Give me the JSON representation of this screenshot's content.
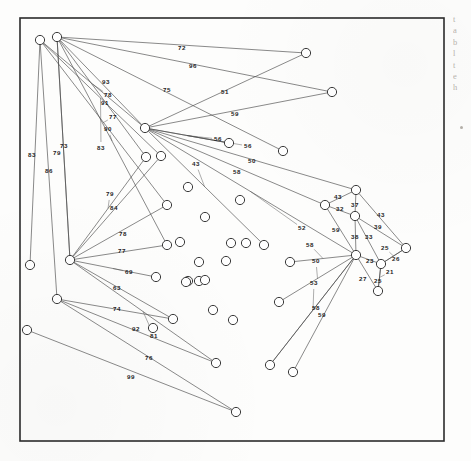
{
  "figure": {
    "frame": {
      "x": 20,
      "y": 18,
      "width": 424,
      "height": 423,
      "stroke": "#2b2b2b",
      "stroke_width": 1.6
    },
    "node_style": {
      "radius": 4.6,
      "stroke": "#3a3a3a",
      "fill": "#ffffff",
      "stroke_width": 1.0
    },
    "edge_style": {
      "stroke": "#4a4a4a",
      "stroke_width": 0.65
    },
    "label_style": {
      "color": "#1d1d1d",
      "font_size": 6.2
    },
    "background": "#fdfdfc"
  },
  "chart_data": {
    "type": "graph",
    "node_count": 46,
    "edge_count": 44,
    "nodes": [
      {
        "id": "n1",
        "x": 40,
        "y": 40
      },
      {
        "id": "n2",
        "x": 57,
        "y": 37
      },
      {
        "id": "n3",
        "x": 145,
        "y": 128
      },
      {
        "id": "n4",
        "x": 70,
        "y": 260
      },
      {
        "id": "n5",
        "x": 57,
        "y": 299
      },
      {
        "id": "n6",
        "x": 306,
        "y": 53
      },
      {
        "id": "n7",
        "x": 332,
        "y": 92
      },
      {
        "id": "n8",
        "x": 283,
        "y": 151
      },
      {
        "id": "n9",
        "x": 356,
        "y": 255
      },
      {
        "id": "n10",
        "x": 356,
        "y": 190
      },
      {
        "id": "n11",
        "x": 325,
        "y": 205
      },
      {
        "id": "n12",
        "x": 355,
        "y": 216
      },
      {
        "id": "n13",
        "x": 406,
        "y": 248
      },
      {
        "id": "n14",
        "x": 381,
        "y": 264
      },
      {
        "id": "n15",
        "x": 378,
        "y": 291
      },
      {
        "id": "n16",
        "x": 30,
        "y": 265
      },
      {
        "id": "n17",
        "x": 27,
        "y": 330
      },
      {
        "id": "n18",
        "x": 146,
        "y": 157
      },
      {
        "id": "n19",
        "x": 161,
        "y": 156
      },
      {
        "id": "n20",
        "x": 167,
        "y": 205
      },
      {
        "id": "n21",
        "x": 167,
        "y": 245
      },
      {
        "id": "n22",
        "x": 188,
        "y": 281
      },
      {
        "id": "n23",
        "x": 173,
        "y": 319
      },
      {
        "id": "n24",
        "x": 153,
        "y": 328
      },
      {
        "id": "n25",
        "x": 236,
        "y": 412
      },
      {
        "id": "n26",
        "x": 216,
        "y": 363
      },
      {
        "id": "n27",
        "x": 290,
        "y": 262
      },
      {
        "id": "n28",
        "x": 264,
        "y": 245
      },
      {
        "id": "n29",
        "x": 240,
        "y": 200
      },
      {
        "id": "n30",
        "x": 188,
        "y": 187
      },
      {
        "id": "n31",
        "x": 205,
        "y": 217
      },
      {
        "id": "n32",
        "x": 231,
        "y": 243
      },
      {
        "id": "n33",
        "x": 246,
        "y": 243
      },
      {
        "id": "n34",
        "x": 199,
        "y": 262
      },
      {
        "id": "n35",
        "x": 226,
        "y": 261
      },
      {
        "id": "n36",
        "x": 199,
        "y": 281
      },
      {
        "id": "n37",
        "x": 205,
        "y": 280
      },
      {
        "id": "n38",
        "x": 213,
        "y": 310
      },
      {
        "id": "n39",
        "x": 233,
        "y": 320
      },
      {
        "id": "n40",
        "x": 279,
        "y": 302
      },
      {
        "id": "n41",
        "x": 270,
        "y": 365
      },
      {
        "id": "n42",
        "x": 293,
        "y": 372
      },
      {
        "id": "n43",
        "x": 156,
        "y": 277
      },
      {
        "id": "n44",
        "x": 229,
        "y": 143
      },
      {
        "id": "n45",
        "x": 186,
        "y": 282
      },
      {
        "id": "n46",
        "x": 180,
        "y": 242
      }
    ],
    "edges": [
      {
        "from": "n2",
        "to": "n6",
        "label": "72",
        "lx": 182,
        "ly": 48
      },
      {
        "from": "n2",
        "to": "n7",
        "label": "96",
        "lx": 193,
        "ly": 66
      },
      {
        "from": "n2",
        "to": "n8",
        "label": "75",
        "lx": 167,
        "ly": 90
      },
      {
        "from": "n3",
        "to": "n6",
        "label": "51",
        "lx": 225,
        "ly": 92
      },
      {
        "from": "n3",
        "to": "n7",
        "label": "59",
        "lx": 235,
        "ly": 114
      },
      {
        "from": "n2",
        "to": "n3",
        "label": "93",
        "lx": 106,
        "ly": 82
      },
      {
        "from": "n1",
        "to": "n3",
        "label": "78",
        "lx": 108,
        "ly": 95
      },
      {
        "from": "n2",
        "to": "n18",
        "label": "91",
        "lx": 105,
        "ly": 103
      },
      {
        "from": "n1",
        "to": "n20",
        "label": "77",
        "lx": 113,
        "ly": 117
      },
      {
        "from": "n2",
        "to": "n21",
        "label": "90",
        "lx": 108,
        "ly": 129
      },
      {
        "from": "n1",
        "to": "n19",
        "label": "83",
        "lx": 101,
        "ly": 148
      },
      {
        "from": "n1",
        "to": "n16",
        "label": "83",
        "lx": 32,
        "ly": 155
      },
      {
        "from": "n1",
        "to": "n5",
        "label": "86",
        "lx": 49,
        "ly": 171
      },
      {
        "from": "n2",
        "to": "n4",
        "label": "79",
        "lx": 57,
        "ly": 153
      },
      {
        "from": "n2",
        "to": "n4",
        "label": "73",
        "lx": 64,
        "ly": 146
      },
      {
        "from": "n4",
        "to": "n18",
        "label": "79",
        "lx": 110,
        "ly": 194
      },
      {
        "from": "n4",
        "to": "n19",
        "label": "84",
        "lx": 114,
        "ly": 208
      },
      {
        "from": "n4",
        "to": "n20",
        "label": "78",
        "lx": 123,
        "ly": 234
      },
      {
        "from": "n4",
        "to": "n21",
        "label": "77",
        "lx": 122,
        "ly": 251
      },
      {
        "from": "n4",
        "to": "n43",
        "label": "69",
        "lx": 129,
        "ly": 272
      },
      {
        "from": "n4",
        "to": "n23",
        "label": "63",
        "lx": 117,
        "ly": 288
      },
      {
        "from": "n5",
        "to": "n23",
        "label": "74",
        "lx": 117,
        "ly": 309
      },
      {
        "from": "n5",
        "to": "n26",
        "label": "92",
        "lx": 136,
        "ly": 329
      },
      {
        "from": "n4",
        "to": "n26",
        "label": "81",
        "lx": 154,
        "ly": 336
      },
      {
        "from": "n5",
        "to": "n25",
        "label": "76",
        "lx": 149,
        "ly": 358
      },
      {
        "from": "n17",
        "to": "n25",
        "label": "99",
        "lx": 131,
        "ly": 377
      },
      {
        "from": "n3",
        "to": "n44",
        "label": "56",
        "lx": 218,
        "ly": 139
      },
      {
        "from": "n3",
        "to": "n44",
        "label": "56",
        "lx": 248,
        "ly": 146
      },
      {
        "from": "n3",
        "to": "n10",
        "label": "50",
        "lx": 252,
        "ly": 161
      },
      {
        "from": "n3",
        "to": "n11",
        "label": "58",
        "lx": 237,
        "ly": 172
      },
      {
        "from": "n3",
        "to": "n28",
        "label": "43",
        "lx": 196,
        "ly": 164
      },
      {
        "from": "n3",
        "to": "n9",
        "label": "52",
        "lx": 302,
        "ly": 228
      },
      {
        "from": "n10",
        "to": "n11",
        "label": "43",
        "lx": 338,
        "ly": 197
      },
      {
        "from": "n11",
        "to": "n12",
        "label": "32",
        "lx": 340,
        "ly": 209
      },
      {
        "from": "n10",
        "to": "n12",
        "label": "37",
        "lx": 355,
        "ly": 205
      },
      {
        "from": "n10",
        "to": "n13",
        "label": "43",
        "lx": 381,
        "ly": 215
      },
      {
        "from": "n12",
        "to": "n13",
        "label": "39",
        "lx": 378,
        "ly": 227
      },
      {
        "from": "n11",
        "to": "n9",
        "label": "59",
        "lx": 336,
        "ly": 230
      },
      {
        "from": "n12",
        "to": "n9",
        "label": "38",
        "lx": 355,
        "ly": 237
      },
      {
        "from": "n12",
        "to": "n14",
        "label": "33",
        "lx": 369,
        "ly": 237
      },
      {
        "from": "n13",
        "to": "n14",
        "label": "25",
        "lx": 385,
        "ly": 248
      },
      {
        "from": "n13",
        "to": "n14",
        "label": "26",
        "lx": 396,
        "ly": 259
      },
      {
        "from": "n9",
        "to": "n14",
        "label": "23",
        "lx": 370,
        "ly": 261
      },
      {
        "from": "n14",
        "to": "n15",
        "label": "21",
        "lx": 390,
        "ly": 272
      },
      {
        "from": "n9",
        "to": "n15",
        "label": "27",
        "lx": 363,
        "ly": 279
      },
      {
        "from": "n14",
        "to": "n15",
        "label": "25",
        "lx": 378,
        "ly": 281
      },
      {
        "from": "n9",
        "to": "n27",
        "label": "58",
        "lx": 310,
        "ly": 245
      },
      {
        "from": "n9",
        "to": "n40",
        "label": "50",
        "lx": 316,
        "ly": 261
      },
      {
        "from": "n9",
        "to": "n41",
        "label": "53",
        "lx": 314,
        "ly": 283
      },
      {
        "from": "n9",
        "to": "n41",
        "label": "58",
        "lx": 316,
        "ly": 308
      },
      {
        "from": "n9",
        "to": "n42",
        "label": "59",
        "lx": 322,
        "ly": 315
      }
    ],
    "edge_labels_all": [
      "72",
      "96",
      "75",
      "51",
      "59",
      "93",
      "78",
      "91",
      "77",
      "90",
      "83",
      "83",
      "86",
      "79",
      "73",
      "79",
      "84",
      "78",
      "77",
      "69",
      "63",
      "74",
      "92",
      "81",
      "76",
      "99",
      "56",
      "56",
      "50",
      "58",
      "43",
      "52",
      "43",
      "32",
      "37",
      "43",
      "39",
      "59",
      "38",
      "33",
      "25",
      "26",
      "23",
      "21",
      "27",
      "25",
      "58",
      "50",
      "53",
      "58",
      "59"
    ]
  },
  "margin": {
    "lines": [
      "t",
      "a",
      "b",
      "l",
      "t",
      "e",
      "h"
    ],
    "bullet": "•"
  }
}
